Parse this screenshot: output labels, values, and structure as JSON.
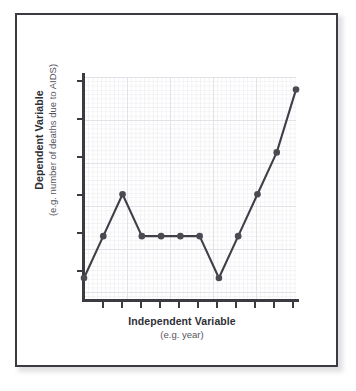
{
  "figure": {
    "frame_border_color": "#3b3b42",
    "background_color": "#ffffff"
  },
  "chart_data": {
    "type": "line",
    "title": "",
    "xlabel": "Independent Variable",
    "xlabel_sub": "(e.g. year)",
    "ylabel": "Dependent Variable",
    "ylabel_sub": "(e.g. number of deaths due to AIDS)",
    "x": [
      0,
      1,
      2,
      3,
      4,
      5,
      6,
      7,
      8,
      9,
      10,
      11
    ],
    "categories": [
      "1",
      "2",
      "3",
      "4",
      "5",
      "6",
      "7",
      "8",
      "9",
      "10",
      "11",
      "12"
    ],
    "values": [
      1.0,
      3.0,
      5.0,
      3.0,
      3.0,
      3.0,
      3.0,
      1.0,
      3.0,
      5.0,
      7.0,
      10.0
    ],
    "series": [
      {
        "name": "deaths due to AIDS",
        "values": [
          1.0,
          3.0,
          5.0,
          3.0,
          3.0,
          3.0,
          3.0,
          1.0,
          3.0,
          5.0,
          7.0,
          10.0
        ],
        "color": "#3f3f48",
        "marker": "circle",
        "marker_color": "#4a4a52"
      }
    ],
    "xlim": [
      0,
      11
    ],
    "ylim": [
      0,
      10.6
    ],
    "xticks": [
      1,
      2,
      3,
      4,
      5,
      6,
      7,
      8,
      9,
      10,
      11
    ],
    "xticklabels": [
      "",
      "",
      "",
      "",
      "",
      "",
      "",
      "",
      "",
      "",
      ""
    ],
    "yticks": [
      1,
      3,
      5,
      7,
      9
    ],
    "yticklabels": [
      "",
      "",
      "",
      "",
      ""
    ],
    "grid": true,
    "grid_major_color": "#e2e2e8",
    "grid_minor_color": "#f2f2f5",
    "legend": false,
    "legend_position": "none",
    "annotations": []
  },
  "axis": {
    "line_color": "#3b3b42",
    "tick_count_x": 11,
    "tick_count_y": 5
  }
}
